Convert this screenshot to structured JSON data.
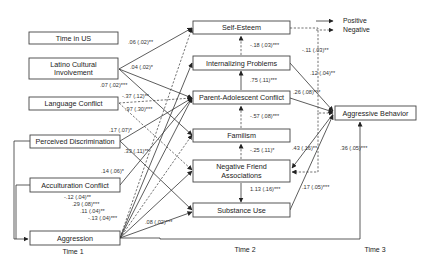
{
  "legend": {
    "positive": "Positive",
    "negative": "Negative"
  },
  "time_labels": {
    "time1": "Time 1",
    "time2": "Time 2",
    "time3": "Time 3"
  },
  "nodes": {
    "time1": {
      "time_in_us": "Time in US",
      "latino_cultural_involvement_line1": "Latino Cultural",
      "latino_cultural_involvement_line2": "Involvement",
      "language_conflict": "Language Conflict",
      "perceived_discrimination": "Perceived Discrimination",
      "acculturation_conflict": "Acculturation Conflict",
      "aggression": "Aggression"
    },
    "time2": {
      "self_esteem": "Self-Esteem",
      "internalizing_problems": "Internalizing Problems",
      "parent_adolescent_conflict": "Parent-Adolescent Conflict",
      "familism": "Familism",
      "negative_friend_associations_line1": "Negative Friend",
      "negative_friend_associations_line2": "Associations",
      "substance_use": "Substance Use"
    },
    "time3": {
      "aggressive_behavior": "Aggressive Behavior"
    }
  },
  "coefficients": {
    "time_in_us_self_esteem": ".06 (.02)**",
    "latino_internalizing": ".04 (.02)*",
    "latino_familism": ".07 (.02)***",
    "language_conflict_parent": "-.37 (.12)**",
    "language_conflict_neg_friend": ".97 (.30)***",
    "perceived_disc_parent": ".17 (.07)*",
    "perceived_disc_substance": ".33 (.11)**",
    "acculturation_parent": ".14 (.06)*",
    "aggression_1": "-.12 (.04)**",
    "aggression_2": ".29 (.08)***",
    "aggression_3": ".11 (.04)**",
    "aggression_4": "-.13 (.04)***",
    "aggression_substance": ".08 (.02)***",
    "internalizing_self_esteem": "-.18 (.03)***",
    "parent_internalizing": ".75 (.11)***",
    "familism_parent": "-.57 (.08)***",
    "neg_friend_familism": "-.25 (.11)*",
    "neg_friend_substance": "1.13 (.16)***",
    "self_esteem_aggressive": "-.11 (.03)**",
    "internalizing_aggressive": ".12 (.04)**",
    "parent_aggressive": ".26 (.08)***",
    "aggressive_neg_friend": ".43 (.16)**",
    "substance_aggressive": ".17 (.05)***",
    "aggression_aggressive": ".36 (.05)***"
  }
}
